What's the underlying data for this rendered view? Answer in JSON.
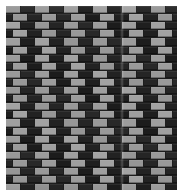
{
  "image": {
    "title": "Basket-weave brick wall pattern",
    "description": "Close-up of a masonry surface of alternating light gray and near-black rectangular tiles laid in an offset running-bond (brick) pattern.",
    "width": 183,
    "height": 190,
    "background_color": "#ffffff"
  },
  "panel": {
    "name": "tiled-wall-panel",
    "left": 6,
    "top": 6,
    "width": 171,
    "height": 184,
    "mortar_color": "#1d1d1d"
  },
  "pattern": {
    "type": "running-bond-checker",
    "tile_width": 14.5,
    "tile_height": 8.1,
    "row_count": 23,
    "columns_per_row": 12,
    "row_offset": 7.25,
    "gap_x": 0.9,
    "gap_y": 0.9
  },
  "colors": {
    "tile_light": "#9c9c9c",
    "tile_light_alt": "#a6a6a6",
    "tile_dark": "#242424",
    "tile_dark_alt": "#1a1a1a",
    "mortar": "#1d1d1d",
    "margin": "#ffffff"
  },
  "seam": {
    "name": "vertical-joint-seam",
    "x": 120,
    "width": 4,
    "visible": true
  }
}
